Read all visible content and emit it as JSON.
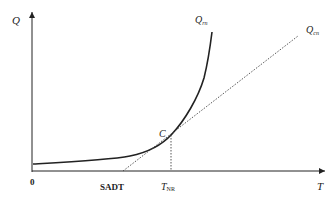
{
  "diagram": {
    "type": "semenov-thermal-explosion",
    "axes": {
      "y_label": "Q",
      "x_label": "T",
      "origin_label": "0"
    },
    "curves": [
      {
        "name": "heat-generation",
        "label_main": "Q",
        "label_sub": "rn",
        "style": "solid"
      },
      {
        "name": "heat-removal",
        "label_main": "Q",
        "label_sub": "cn",
        "style": "dotted"
      }
    ],
    "points": {
      "tangent_point": "C"
    },
    "x_markers": {
      "sadt": "SADT",
      "tnr_main": "T",
      "tnr_sub": "NR"
    },
    "colors": {
      "line": "#222222",
      "background": "#ffffff"
    }
  }
}
